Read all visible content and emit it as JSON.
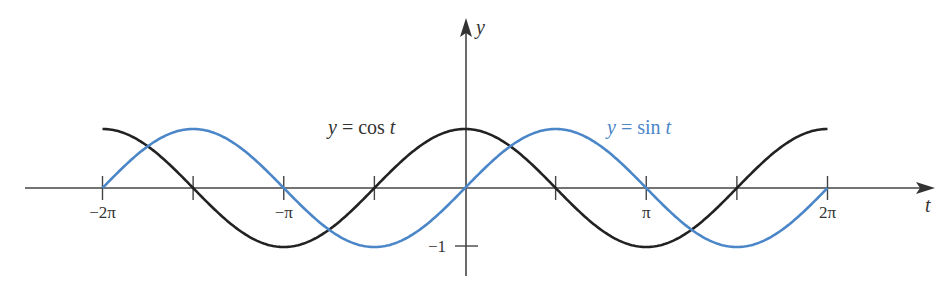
{
  "chart_data": {
    "type": "line",
    "title": "",
    "xlabel": "t",
    "ylabel": "y",
    "xlim": [
      -6.2832,
      6.2832
    ],
    "ylim": [
      -1,
      1
    ],
    "x_ticks": [
      {
        "value": -6.2832,
        "label": "−2π"
      },
      {
        "value": -4.7124,
        "label": ""
      },
      {
        "value": -3.1416,
        "label": "−π"
      },
      {
        "value": -1.5708,
        "label": ""
      },
      {
        "value": 1.5708,
        "label": ""
      },
      {
        "value": 3.1416,
        "label": "π"
      },
      {
        "value": 4.7124,
        "label": ""
      },
      {
        "value": 6.2832,
        "label": "2π"
      }
    ],
    "y_ticks": [
      {
        "value": -1,
        "label": "−1"
      }
    ],
    "grid": false,
    "series": [
      {
        "name": "cos",
        "function": "cos(t)",
        "label_prefix": "y = cos ",
        "label_var": "t",
        "color": "#222222",
        "domain": [
          -6.2832,
          6.2832
        ]
      },
      {
        "name": "sin",
        "function": "sin(t)",
        "label_prefix": "y = sin ",
        "label_var": "t",
        "color": "#4a86c8",
        "domain": [
          -6.2832,
          6.2832
        ]
      }
    ]
  }
}
